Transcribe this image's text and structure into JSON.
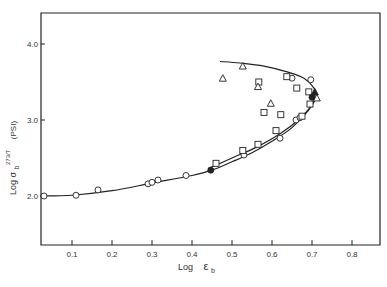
{
  "chart_data": {
    "type": "scatter",
    "title": "",
    "xlabel": "Log ε_b",
    "ylabel": "Log σ_b 273/T (PSI)",
    "xlim": [
      0.02,
      0.87
    ],
    "ylim": [
      1.35,
      4.45
    ],
    "xticks": [
      0.1,
      0.2,
      0.3,
      0.4,
      0.5,
      0.6,
      0.7,
      0.8
    ],
    "xtick_labels": [
      "0.1",
      "0.2",
      "0.3",
      "0.4",
      "0.5",
      "0.6",
      "0.7",
      "0.8"
    ],
    "yticks": [
      2.0,
      3.0,
      4.0
    ],
    "ytick_labels": [
      "2.0",
      "3.0",
      "4.0"
    ],
    "grid": false,
    "legend": null,
    "series": [
      {
        "name": "open circles",
        "marker": "circle-open",
        "points": [
          [
            0.03,
            2.0
          ],
          [
            0.11,
            2.01
          ],
          [
            0.165,
            2.08
          ],
          [
            0.29,
            2.16
          ],
          [
            0.3,
            2.18
          ],
          [
            0.315,
            2.21
          ],
          [
            0.385,
            2.27
          ],
          [
            0.53,
            2.54
          ],
          [
            0.62,
            2.76
          ],
          [
            0.66,
            3.0
          ],
          [
            0.67,
            3.03
          ],
          [
            0.65,
            3.55
          ],
          [
            0.697,
            3.53
          ]
        ]
      },
      {
        "name": "open squares",
        "marker": "square-open",
        "points": [
          [
            0.46,
            2.43
          ],
          [
            0.527,
            2.6
          ],
          [
            0.565,
            2.68
          ],
          [
            0.61,
            2.86
          ],
          [
            0.675,
            3.05
          ],
          [
            0.695,
            3.21
          ],
          [
            0.692,
            3.37
          ],
          [
            0.662,
            3.42
          ],
          [
            0.637,
            3.57
          ],
          [
            0.567,
            3.5
          ],
          [
            0.58,
            3.1
          ],
          [
            0.622,
            3.07
          ]
        ]
      },
      {
        "name": "open triangles",
        "marker": "triangle-open",
        "points": [
          [
            0.477,
            3.55
          ],
          [
            0.527,
            3.71
          ],
          [
            0.565,
            3.44
          ],
          [
            0.597,
            3.22
          ],
          [
            0.712,
            3.29
          ]
        ]
      },
      {
        "name": "filled circles",
        "marker": "circle-filled",
        "points": [
          [
            0.447,
            2.34
          ],
          [
            0.7,
            3.3
          ]
        ]
      },
      {
        "name": "filled triangles",
        "marker": "triangle-filled",
        "points": [
          [
            0.707,
            3.37
          ]
        ]
      }
    ],
    "curves": [
      {
        "name": "failure envelope",
        "points": [
          [
            0.02,
            2.0
          ],
          [
            0.1,
            2.01
          ],
          [
            0.2,
            2.07
          ],
          [
            0.3,
            2.17
          ],
          [
            0.4,
            2.27
          ],
          [
            0.45,
            2.34
          ],
          [
            0.5,
            2.45
          ],
          [
            0.55,
            2.57
          ],
          [
            0.6,
            2.72
          ],
          [
            0.65,
            2.9
          ],
          [
            0.69,
            3.12
          ],
          [
            0.71,
            3.3
          ],
          [
            0.705,
            3.42
          ],
          [
            0.68,
            3.55
          ],
          [
            0.64,
            3.63
          ],
          [
            0.58,
            3.71
          ],
          [
            0.52,
            3.75
          ],
          [
            0.47,
            3.77
          ]
        ]
      },
      {
        "name": "inner branch",
        "points": [
          [
            0.44,
            2.36
          ],
          [
            0.5,
            2.5
          ],
          [
            0.56,
            2.64
          ],
          [
            0.62,
            2.82
          ],
          [
            0.67,
            3.02
          ],
          [
            0.7,
            3.2
          ],
          [
            0.71,
            3.3
          ]
        ]
      }
    ]
  },
  "axes": {
    "x_label_main": "Log",
    "x_label_symbol": "ε",
    "x_label_sub": "b",
    "y_label_text": "Log σ",
    "y_label_sub": "b",
    "y_label_frac": "273/T",
    "y_label_unit": "(PSI)"
  }
}
